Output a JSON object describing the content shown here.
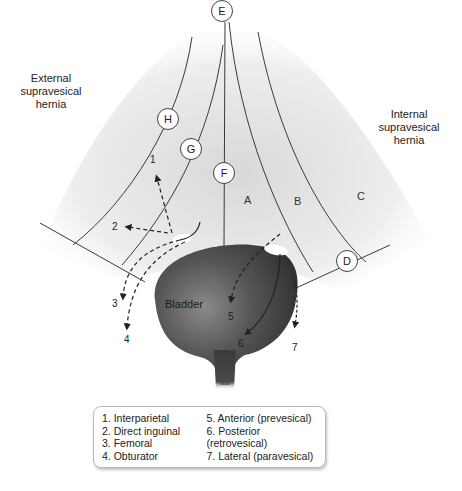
{
  "labels": {
    "external": "External supravesical hernia",
    "external_lines": [
      "External",
      "supravesical",
      "hernia"
    ],
    "internal_lines": [
      "Internal",
      "supravesical",
      "hernia"
    ],
    "bladder": "Bladder"
  },
  "circles": {
    "E": "E",
    "H": "H",
    "G": "G",
    "F": "F",
    "D": "D"
  },
  "zones": {
    "A": "A",
    "B": "B",
    "C": "C"
  },
  "path_numbers": {
    "n1": "1",
    "n2": "2",
    "n3": "3",
    "n4": "4",
    "n5": "5",
    "n6": "6",
    "n7": "7"
  },
  "legend": {
    "left": [
      "1. Interparietal",
      "2. Direct inguinal",
      "3. Femoral",
      "4. Obturator"
    ],
    "right": [
      "5. Anterior (prevesical)",
      "6. Posterior (retrovesical)",
      "7. Lateral (paravesical)"
    ]
  },
  "colors": {
    "bladder": "#3c3c3c",
    "line": "#333333",
    "background_shade": "#e8e8e8"
  }
}
